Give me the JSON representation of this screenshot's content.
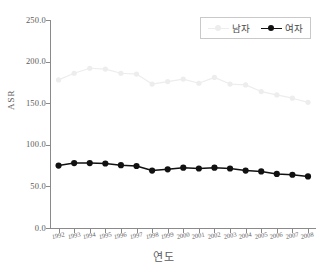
{
  "chart_data": {
    "type": "line",
    "title": "",
    "subtitle": "",
    "xlabel": "연도",
    "ylabel": "ASR",
    "categories": [
      "1992",
      "1993",
      "1994",
      "1995",
      "1996",
      "1997",
      "1998",
      "1999",
      "2000",
      "2001",
      "2002",
      "2003",
      "2004",
      "2005",
      "2006",
      "2007",
      "2008"
    ],
    "x": [
      1992,
      1993,
      1994,
      1995,
      1996,
      1997,
      1998,
      1999,
      2000,
      2001,
      2002,
      2003,
      2004,
      2005,
      2006,
      2007,
      2008
    ],
    "series": [
      {
        "name": "남자",
        "color": "#ededed",
        "marker": "circle",
        "values": [
          178.0,
          186.0,
          192.0,
          191.0,
          186.0,
          185.0,
          173.0,
          176.0,
          179.0,
          174.0,
          181.0,
          173.0,
          172.0,
          164.0,
          160.0,
          156.0,
          151.0
        ]
      },
      {
        "name": "여자",
        "color": "#111111",
        "marker": "circle",
        "values": [
          75.0,
          78.0,
          78.0,
          77.5,
          75.5,
          74.5,
          69.0,
          70.5,
          72.5,
          71.5,
          72.5,
          71.5,
          69.0,
          68.0,
          65.0,
          64.0,
          62.0
        ]
      }
    ],
    "ylim": [
      0,
      250
    ],
    "xlim": [
      1992,
      2008
    ],
    "y_ticks": [
      0,
      50,
      100,
      150,
      200,
      250
    ],
    "y_tick_labels": [
      "0.0",
      "50.0",
      "100.0",
      "150.0",
      "200.0",
      "250.0"
    ],
    "grid": false,
    "legend_position": "top-right"
  },
  "legend": {
    "entries": [
      {
        "label": "남자"
      },
      {
        "label": "여자"
      }
    ]
  },
  "axes": {
    "y_title": "ASR",
    "x_title": "연도"
  }
}
